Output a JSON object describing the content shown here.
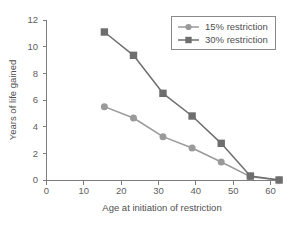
{
  "chart_data": {
    "type": "line",
    "title": "",
    "xlabel": "Age at initiation of restriction",
    "ylabel": "Years of life gained",
    "xlim": [
      0,
      64
    ],
    "ylim": [
      0,
      12
    ],
    "xticks": [
      0,
      10,
      20,
      30,
      40,
      50,
      60
    ],
    "xticklabels": [
      "0",
      "10",
      "20",
      "30",
      "40",
      "50",
      "60"
    ],
    "yticks": [
      0,
      2,
      4,
      6,
      8,
      10,
      12
    ],
    "yticklabels": [
      "0",
      "2",
      "4",
      "6",
      "8",
      "10",
      "12"
    ],
    "grid": false,
    "legend_position": "upper right",
    "x": [
      15.5,
      23.3,
      31.2,
      39.0,
      46.8,
      54.6,
      62.3
    ],
    "series": [
      {
        "name": "15% restriction",
        "values": [
          5.5,
          4.65,
          3.25,
          2.4,
          1.35,
          0.25,
          0.0
        ],
        "color": "#9a9a9a",
        "marker": "circle"
      },
      {
        "name": "30% restriction",
        "values": [
          11.1,
          9.35,
          6.5,
          4.8,
          2.75,
          0.3,
          0.0
        ],
        "color": "#6e6e6e",
        "marker": "square"
      }
    ]
  },
  "legend": {
    "entries": [
      {
        "label": "15% restriction"
      },
      {
        "label": "30% restriction"
      }
    ]
  },
  "caption": {
    "clipped_line": "................................................."
  }
}
